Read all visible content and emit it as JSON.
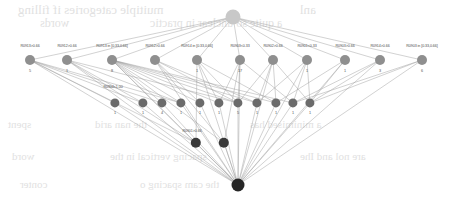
{
  "diagram": {
    "type": "bayesian-network-tree",
    "title": "",
    "colors": {
      "root_top": "#c8c8c8",
      "level1": "#8f8f8f",
      "level2": "#6b6b6b",
      "level3": "#3a3a3a",
      "root_bottom": "#262626",
      "edge": "#9a9a9a",
      "label_text": "#4a4a4a"
    },
    "root_top": {
      "x": 233,
      "y": 17,
      "r": 7.5
    },
    "root_bottom": {
      "x": 238,
      "y": 185,
      "r": 6.5
    },
    "level1": {
      "nodes": [
        {
          "x": 30,
          "y": 60,
          "r": 5.0,
          "label": "R0913>0.66",
          "count": "5"
        },
        {
          "x": 67,
          "y": 60,
          "r": 5.0,
          "label": "R0912>0.66",
          "count": "1"
        },
        {
          "x": 112,
          "y": 60,
          "r": 5.0,
          "label": "R0913 in [0.33,0.66]",
          "count": "8"
        },
        {
          "x": 155,
          "y": 60,
          "r": 5.0,
          "label": "R0912>0.66",
          "count": ""
        },
        {
          "x": 197,
          "y": 60,
          "r": 5.0,
          "label": "R0914 in [0.33,0.66]",
          "count": "1"
        },
        {
          "x": 240,
          "y": 60,
          "r": 5.0,
          "label": "R0903<0.33",
          "count": "17"
        },
        {
          "x": 273,
          "y": 60,
          "r": 5.0,
          "label": "R0902>0.66",
          "count": ""
        },
        {
          "x": 307,
          "y": 60,
          "r": 5.0,
          "label": "R0901<0.33",
          "count": "1"
        },
        {
          "x": 345,
          "y": 60,
          "r": 5.0,
          "label": "R0903>0.66",
          "count": "1"
        },
        {
          "x": 380,
          "y": 60,
          "r": 5.0,
          "label": "R0914>0.66",
          "count": "3"
        },
        {
          "x": 422,
          "y": 60,
          "r": 5.0,
          "label": "R0903 in [0.33,0.66]",
          "count": "6"
        }
      ]
    },
    "level2": {
      "group_label": "R0904<1.00",
      "group_label_x": 113,
      "group_label_y": 87,
      "nodes": [
        {
          "x": 115,
          "y": 103,
          "r": 4.6,
          "count": "1"
        },
        {
          "x": 143,
          "y": 103,
          "r": 4.6,
          "count": "1"
        },
        {
          "x": 162,
          "y": 103,
          "r": 4.6,
          "count": "4"
        },
        {
          "x": 181,
          "y": 103,
          "r": 4.6,
          "count": "1"
        },
        {
          "x": 200,
          "y": 103,
          "r": 4.6,
          "count": "1"
        },
        {
          "x": 219,
          "y": 103,
          "r": 4.6,
          "count": "1"
        },
        {
          "x": 238,
          "y": 103,
          "r": 4.6,
          "count": "5"
        },
        {
          "x": 257,
          "y": 103,
          "r": 4.6,
          "count": "1"
        },
        {
          "x": 276,
          "y": 103,
          "r": 4.6,
          "count": "1"
        },
        {
          "x": 293,
          "y": 103,
          "r": 4.6,
          "count": "1"
        },
        {
          "x": 310,
          "y": 103,
          "r": 4.6,
          "count": "1"
        }
      ]
    },
    "level3": {
      "group_label": "R0901>0.66",
      "group_label_x": 192,
      "group_label_y": 131,
      "nodes": [
        {
          "x": 196,
          "y": 143,
          "r": 5.2,
          "count": ""
        },
        {
          "x": 224,
          "y": 143,
          "r": 5.2,
          "count": ""
        }
      ]
    },
    "ghost_text": [
      {
        "x": 18,
        "y": 2,
        "size": 13,
        "text": "muitiple categories if filling"
      },
      {
        "x": 300,
        "y": 2,
        "size": 13,
        "text": "anl"
      },
      {
        "x": 40,
        "y": 16,
        "size": 12,
        "text": "words"
      },
      {
        "x": 150,
        "y": 16,
        "size": 12,
        "text": "a quite so unclear in practic"
      },
      {
        "x": 8,
        "y": 118,
        "size": 11,
        "text": "spent"
      },
      {
        "x": 95,
        "y": 118,
        "size": 11,
        "text": "the  nan  arid"
      },
      {
        "x": 250,
        "y": 118,
        "size": 11,
        "text": "a minimised  has"
      },
      {
        "x": 12,
        "y": 150,
        "size": 11,
        "text": "word"
      },
      {
        "x": 110,
        "y": 150,
        "size": 11,
        "text": "spacing  vertical  in the"
      },
      {
        "x": 300,
        "y": 150,
        "size": 11,
        "text": "are  nol  and  Ihe"
      },
      {
        "x": 20,
        "y": 178,
        "size": 11,
        "text": "conter"
      },
      {
        "x": 140,
        "y": 178,
        "size": 11,
        "text": "the cam  spacing  o"
      }
    ],
    "edges": [
      [
        233,
        17,
        30,
        60
      ],
      [
        233,
        17,
        67,
        60
      ],
      [
        233,
        17,
        112,
        60
      ],
      [
        233,
        17,
        155,
        60
      ],
      [
        233,
        17,
        197,
        60
      ],
      [
        233,
        17,
        240,
        60
      ],
      [
        233,
        17,
        273,
        60
      ],
      [
        233,
        17,
        307,
        60
      ],
      [
        233,
        17,
        345,
        60
      ],
      [
        233,
        17,
        380,
        60
      ],
      [
        233,
        17,
        422,
        60
      ],
      [
        30,
        60,
        115,
        103
      ],
      [
        30,
        60,
        143,
        103
      ],
      [
        30,
        60,
        162,
        103
      ],
      [
        30,
        60,
        181,
        103
      ],
      [
        67,
        60,
        143,
        103
      ],
      [
        67,
        60,
        181,
        103
      ],
      [
        67,
        60,
        238,
        103
      ],
      [
        112,
        60,
        162,
        103
      ],
      [
        112,
        60,
        181,
        103
      ],
      [
        112,
        60,
        200,
        103
      ],
      [
        112,
        60,
        219,
        103
      ],
      [
        112,
        60,
        238,
        103
      ],
      [
        112,
        60,
        257,
        103
      ],
      [
        112,
        60,
        276,
        103
      ],
      [
        112,
        60,
        293,
        103
      ],
      [
        155,
        60,
        200,
        103
      ],
      [
        155,
        60,
        238,
        103
      ],
      [
        155,
        60,
        257,
        103
      ],
      [
        197,
        60,
        219,
        103
      ],
      [
        197,
        60,
        238,
        103
      ],
      [
        197,
        60,
        276,
        103
      ],
      [
        240,
        60,
        219,
        103
      ],
      [
        240,
        60,
        238,
        103
      ],
      [
        240,
        60,
        293,
        103
      ],
      [
        273,
        60,
        238,
        103
      ],
      [
        273,
        60,
        257,
        103
      ],
      [
        273,
        60,
        276,
        103
      ],
      [
        273,
        60,
        310,
        103
      ],
      [
        307,
        60,
        257,
        103
      ],
      [
        307,
        60,
        293,
        103
      ],
      [
        307,
        60,
        310,
        103
      ],
      [
        345,
        60,
        276,
        103
      ],
      [
        345,
        60,
        310,
        103
      ],
      [
        380,
        60,
        293,
        103
      ],
      [
        380,
        60,
        310,
        103
      ],
      [
        422,
        60,
        310,
        103
      ],
      [
        422,
        60,
        293,
        103
      ],
      [
        30,
        60,
        196,
        143
      ],
      [
        67,
        60,
        196,
        143
      ],
      [
        112,
        60,
        196,
        143
      ],
      [
        112,
        60,
        224,
        143
      ],
      [
        155,
        60,
        224,
        143
      ],
      [
        197,
        60,
        196,
        143
      ],
      [
        240,
        60,
        224,
        143
      ],
      [
        115,
        103,
        238,
        185
      ],
      [
        143,
        103,
        238,
        185
      ],
      [
        162,
        103,
        238,
        185
      ],
      [
        181,
        103,
        238,
        185
      ],
      [
        200,
        103,
        238,
        185
      ],
      [
        219,
        103,
        238,
        185
      ],
      [
        238,
        103,
        238,
        185
      ],
      [
        257,
        103,
        238,
        185
      ],
      [
        276,
        103,
        238,
        185
      ],
      [
        293,
        103,
        238,
        185
      ],
      [
        310,
        103,
        238,
        185
      ],
      [
        196,
        143,
        238,
        185
      ],
      [
        224,
        143,
        238,
        185
      ],
      [
        30,
        60,
        238,
        185
      ],
      [
        67,
        60,
        238,
        185
      ],
      [
        422,
        60,
        238,
        185
      ],
      [
        380,
        60,
        238,
        185
      ],
      [
        345,
        60,
        238,
        185
      ],
      [
        307,
        60,
        238,
        185
      ],
      [
        240,
        60,
        238,
        185
      ],
      [
        197,
        60,
        238,
        185
      ],
      [
        155,
        60,
        238,
        185
      ],
      [
        112,
        60,
        238,
        185
      ],
      [
        273,
        60,
        238,
        185
      ]
    ]
  }
}
